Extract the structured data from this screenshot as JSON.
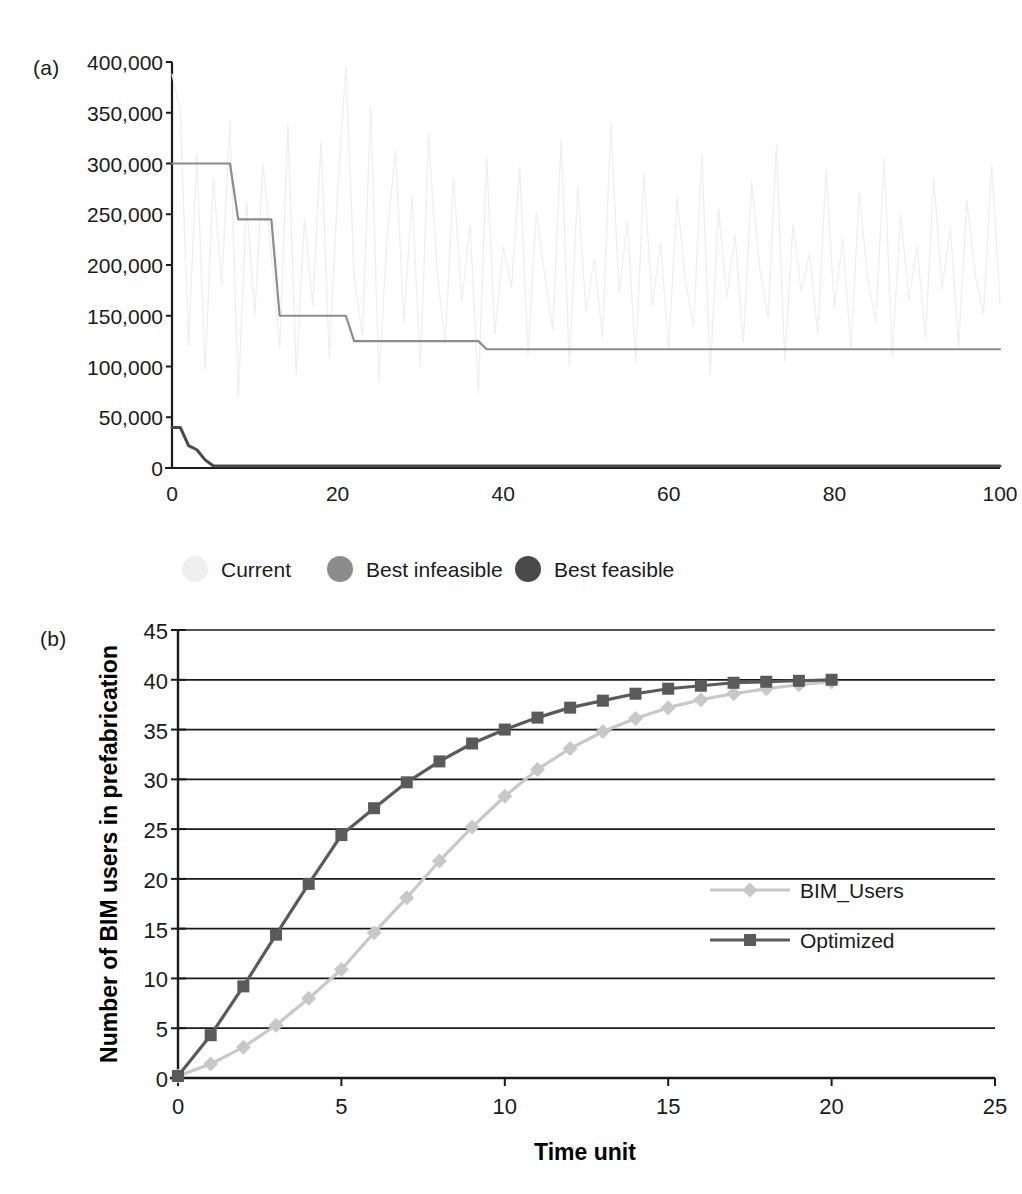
{
  "figure": {
    "panel_a_tag": "(a)",
    "panel_b_tag": "(b)"
  },
  "chart_data": [
    {
      "id": "panel-a",
      "type": "line",
      "title": "",
      "xlabel": "",
      "ylabel": "",
      "xlim": [
        0,
        100
      ],
      "ylim": [
        0,
        400000
      ],
      "xticks": [
        0,
        20,
        40,
        60,
        80,
        100
      ],
      "xtick_labels": [
        "0",
        "20",
        "40",
        "60",
        "80",
        "100"
      ],
      "yticks": [
        0,
        50000,
        100000,
        150000,
        200000,
        250000,
        300000,
        350000,
        400000
      ],
      "ytick_labels": [
        "0",
        "50,000",
        "100,000",
        "150,000",
        "200,000",
        "250,000",
        "300,000",
        "350,000",
        "400,000"
      ],
      "grid": false,
      "legend_position": "below",
      "legend": [
        "Current",
        "Best infeasible",
        "Best feasible"
      ],
      "series": [
        {
          "name": "Current",
          "marker": "circle",
          "color": "#efefef",
          "x": [
            0,
            1,
            2,
            3,
            4,
            5,
            6,
            7,
            8,
            9,
            10,
            11,
            12,
            13,
            14,
            15,
            16,
            17,
            18,
            19,
            20,
            21,
            22,
            23,
            24,
            25,
            26,
            27,
            28,
            29,
            30,
            31,
            32,
            33,
            34,
            35,
            36,
            37,
            38,
            39,
            40,
            41,
            42,
            43,
            44,
            45,
            46,
            47,
            48,
            49,
            50,
            51,
            52,
            53,
            54,
            55,
            56,
            57,
            58,
            59,
            60,
            61,
            62,
            63,
            64,
            65,
            66,
            67,
            68,
            69,
            70,
            71,
            72,
            73,
            74,
            75,
            76,
            77,
            78,
            79,
            80,
            81,
            82,
            83,
            84,
            85,
            86,
            87,
            88,
            89,
            90,
            91,
            92,
            93,
            94,
            95,
            96,
            97,
            98,
            99,
            100
          ],
          "values": [
            388000,
            352000,
            120000,
            310000,
            96000,
            286000,
            180000,
            342000,
            70000,
            262000,
            150000,
            300000,
            210000,
            118000,
            338000,
            92000,
            246000,
            160000,
            322000,
            108000,
            272000,
            396000,
            188000,
            130000,
            356000,
            86000,
            232000,
            312000,
            144000,
            268000,
            100000,
            330000,
            196000,
            122000,
            286000,
            164000,
            240000,
            74000,
            306000,
            132000,
            218000,
            178000,
            296000,
            112000,
            252000,
            190000,
            136000,
            324000,
            98000,
            278000,
            154000,
            206000,
            128000,
            340000,
            172000,
            244000,
            104000,
            290000,
            160000,
            222000,
            116000,
            268000,
            184000,
            140000,
            310000,
            92000,
            256000,
            168000,
            230000,
            124000,
            282000,
            196000,
            148000,
            318000,
            106000,
            240000,
            174000,
            212000,
            132000,
            294000,
            158000,
            226000,
            118000,
            272000,
            186000,
            144000,
            304000,
            110000,
            250000,
            166000,
            218000,
            128000,
            286000,
            176000,
            236000,
            120000,
            264000,
            190000,
            152000,
            298000,
            162000
          ]
        },
        {
          "name": "Best infeasible",
          "marker": "circle",
          "color": "#8c8c8c",
          "x": [
            0,
            1,
            2,
            3,
            4,
            5,
            6,
            7,
            8,
            9,
            10,
            11,
            12,
            13,
            14,
            15,
            16,
            17,
            18,
            19,
            20,
            21,
            22,
            23,
            37,
            38,
            39,
            100
          ],
          "values": [
            300000,
            300000,
            300000,
            300000,
            300000,
            300000,
            300000,
            300000,
            245000,
            245000,
            245000,
            245000,
            245000,
            150000,
            150000,
            150000,
            150000,
            150000,
            150000,
            150000,
            150000,
            150000,
            125000,
            125000,
            125000,
            117000,
            117000,
            117000
          ]
        },
        {
          "name": "Best feasible",
          "marker": "circle",
          "color": "#4a4a4a",
          "x": [
            0,
            1,
            2,
            3,
            4,
            5,
            6,
            100
          ],
          "values": [
            40000,
            40000,
            22000,
            18000,
            8000,
            2000,
            2000,
            2000
          ]
        }
      ]
    },
    {
      "id": "panel-b",
      "type": "line",
      "title": "",
      "xlabel": "Time unit",
      "ylabel": "Number of BIM users in prefabrication",
      "xlim": [
        0,
        25
      ],
      "ylim": [
        0,
        45
      ],
      "xticks": [
        0,
        5,
        10,
        15,
        20,
        25
      ],
      "xtick_labels": [
        "0",
        "5",
        "10",
        "15",
        "20",
        "25"
      ],
      "yticks": [
        0,
        5,
        10,
        15,
        20,
        25,
        30,
        35,
        40,
        45
      ],
      "ytick_labels": [
        "0",
        "5",
        "10",
        "15",
        "20",
        "25",
        "30",
        "35",
        "40",
        "45"
      ],
      "grid": true,
      "legend_position": "inside-right",
      "legend": [
        "BIM_Users",
        "Optimized"
      ],
      "categories": [
        0,
        1,
        2,
        3,
        4,
        5,
        6,
        7,
        8,
        9,
        10,
        11,
        12,
        13,
        14,
        15,
        16,
        17,
        18,
        19,
        20
      ],
      "series": [
        {
          "name": "BIM_Users",
          "marker": "diamond",
          "color": "#c8c8c8",
          "x": [
            0,
            1,
            2,
            3,
            4,
            5,
            6,
            7,
            8,
            9,
            10,
            11,
            12,
            13,
            14,
            15,
            16,
            17,
            18,
            19,
            20
          ],
          "values": [
            0.2,
            1.4,
            3.1,
            5.3,
            8.0,
            10.9,
            14.6,
            18.1,
            21.8,
            25.2,
            28.3,
            31.0,
            33.1,
            34.8,
            36.1,
            37.2,
            38.0,
            38.6,
            39.1,
            39.5,
            39.8
          ]
        },
        {
          "name": "Optimized",
          "marker": "square",
          "color": "#5a5a5a",
          "x": [
            0,
            1,
            2,
            3,
            4,
            5,
            6,
            7,
            8,
            9,
            10,
            11,
            12,
            13,
            14,
            15,
            16,
            17,
            18,
            19,
            20
          ],
          "values": [
            0.2,
            4.3,
            9.2,
            14.4,
            19.5,
            24.4,
            27.1,
            29.7,
            31.8,
            33.6,
            35.0,
            36.2,
            37.2,
            37.9,
            38.6,
            39.1,
            39.4,
            39.7,
            39.8,
            39.9,
            40.0
          ]
        }
      ]
    }
  ]
}
